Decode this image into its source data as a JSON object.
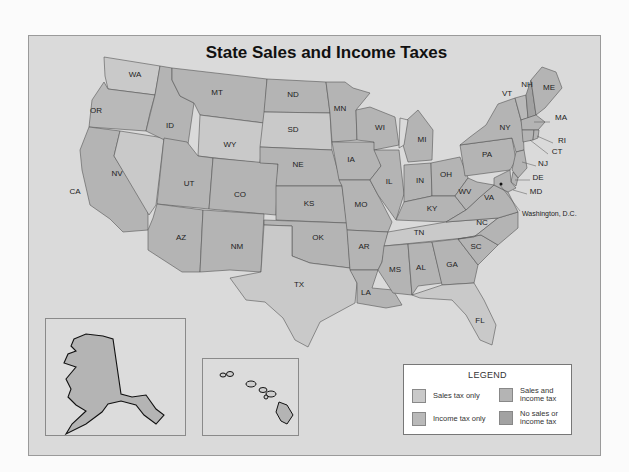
{
  "title": "State Sales and Income Taxes",
  "colors": {
    "background": "#fbfbfb",
    "panel": "#dadada",
    "sales_tax_only": "#c9c9c9",
    "income_tax_only": "#b9b9b9",
    "sales_and_income_tax": "#b4b4b4",
    "no_sales_or_income_tax": "#a2a2a2",
    "outline": "#111111"
  },
  "legend": {
    "title": "LEGEND",
    "items": [
      {
        "key": "sales_tax_only",
        "label": "Sales tax only"
      },
      {
        "key": "sales_and_income_tax",
        "label": "Sales and\nincome tax"
      },
      {
        "key": "income_tax_only",
        "label": "Income tax only"
      },
      {
        "key": "no_sales_or_income_tax",
        "label": "No sales or\nincome tax"
      }
    ]
  },
  "states": [
    {
      "abbr": "WA",
      "x": 135,
      "y": 77
    },
    {
      "abbr": "OR",
      "x": 96,
      "y": 113
    },
    {
      "abbr": "CA",
      "x": 75,
      "y": 194
    },
    {
      "abbr": "NV",
      "x": 117,
      "y": 176
    },
    {
      "abbr": "ID",
      "x": 170,
      "y": 128
    },
    {
      "abbr": "MT",
      "x": 217,
      "y": 95
    },
    {
      "abbr": "WY",
      "x": 230,
      "y": 147
    },
    {
      "abbr": "UT",
      "x": 189,
      "y": 186
    },
    {
      "abbr": "CO",
      "x": 240,
      "y": 197
    },
    {
      "abbr": "AZ",
      "x": 181,
      "y": 240
    },
    {
      "abbr": "NM",
      "x": 237,
      "y": 249
    },
    {
      "abbr": "ND",
      "x": 293,
      "y": 97
    },
    {
      "abbr": "SD",
      "x": 293,
      "y": 132
    },
    {
      "abbr": "NE",
      "x": 298,
      "y": 167
    },
    {
      "abbr": "KS",
      "x": 309,
      "y": 206
    },
    {
      "abbr": "OK",
      "x": 318,
      "y": 240
    },
    {
      "abbr": "TX",
      "x": 299,
      "y": 287
    },
    {
      "abbr": "MN",
      "x": 340,
      "y": 111
    },
    {
      "abbr": "IA",
      "x": 351,
      "y": 162
    },
    {
      "abbr": "MO",
      "x": 361,
      "y": 207
    },
    {
      "abbr": "AR",
      "x": 364,
      "y": 249
    },
    {
      "abbr": "LA",
      "x": 366,
      "y": 295
    },
    {
      "abbr": "WI",
      "x": 380,
      "y": 130
    },
    {
      "abbr": "IL",
      "x": 389,
      "y": 184
    },
    {
      "abbr": "MI",
      "x": 422,
      "y": 142
    },
    {
      "abbr": "IN",
      "x": 420,
      "y": 183
    },
    {
      "abbr": "OH",
      "x": 446,
      "y": 177
    },
    {
      "abbr": "KY",
      "x": 432,
      "y": 211
    },
    {
      "abbr": "TN",
      "x": 419,
      "y": 235
    },
    {
      "abbr": "MS",
      "x": 395,
      "y": 272
    },
    {
      "abbr": "AL",
      "x": 421,
      "y": 270
    },
    {
      "abbr": "GA",
      "x": 452,
      "y": 267
    },
    {
      "abbr": "FL",
      "x": 480,
      "y": 323
    },
    {
      "abbr": "SC",
      "x": 476,
      "y": 249
    },
    {
      "abbr": "NC",
      "x": 482,
      "y": 225
    },
    {
      "abbr": "VA",
      "x": 489,
      "y": 200
    },
    {
      "abbr": "WV",
      "x": 465,
      "y": 194
    },
    {
      "abbr": "PA",
      "x": 487,
      "y": 157
    },
    {
      "abbr": "NY",
      "x": 505,
      "y": 130
    },
    {
      "abbr": "VT",
      "x": 507,
      "y": 96
    },
    {
      "abbr": "NH",
      "x": 527,
      "y": 87
    },
    {
      "abbr": "ME",
      "x": 549,
      "y": 90
    },
    {
      "abbr": "MA",
      "x": 561,
      "y": 120
    },
    {
      "abbr": "RI",
      "x": 562,
      "y": 143
    },
    {
      "abbr": "CT",
      "x": 557,
      "y": 154
    },
    {
      "abbr": "NJ",
      "x": 543,
      "y": 166
    },
    {
      "abbr": "DE",
      "x": 538,
      "y": 180
    },
    {
      "abbr": "MD",
      "x": 536,
      "y": 194
    },
    {
      "abbr": "AK",
      "x": 97,
      "y": 369
    },
    {
      "abbr": "HI",
      "x": 246,
      "y": 406
    }
  ],
  "annotations": {
    "dc": "Washington, D.C."
  },
  "insets": {
    "alaska": "AK",
    "hawaii": "HI"
  }
}
